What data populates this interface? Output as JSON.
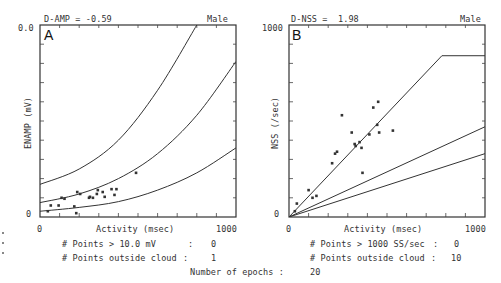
{
  "chart_data": [
    {
      "type": "scatter",
      "panel": "A",
      "title": "D-AMP = -0.59",
      "subtitle": "Male",
      "xlabel": "Activity (msec)",
      "ylabel": "ENAMP (mV)",
      "xlim": [
        0,
        1000
      ],
      "ylim": [
        0,
        10.0
      ],
      "x_tick_labels": [
        "0",
        "1000"
      ],
      "y_tick_labels": [
        "0",
        "0.0"
      ],
      "grid": false,
      "curves": [
        {
          "name": "upper",
          "points": [
            [
              0,
              1.7
            ],
            [
              200,
              2.5
            ],
            [
              400,
              4.0
            ],
            [
              600,
              6.6
            ],
            [
              800,
              10.0
            ]
          ]
        },
        {
          "name": "middle",
          "points": [
            [
              0,
              0.75
            ],
            [
              200,
              1.2
            ],
            [
              400,
              2.0
            ],
            [
              600,
              3.3
            ],
            [
              800,
              5.3
            ],
            [
              1000,
              8.1
            ]
          ]
        },
        {
          "name": "lower",
          "points": [
            [
              0,
              0.3
            ],
            [
              200,
              0.5
            ],
            [
              400,
              0.8
            ],
            [
              600,
              1.4
            ],
            [
              800,
              2.3
            ],
            [
              1000,
              3.6
            ]
          ]
        }
      ],
      "points": [
        [
          40,
          0.3
        ],
        [
          55,
          0.6
        ],
        [
          95,
          0.6
        ],
        [
          110,
          1.0
        ],
        [
          125,
          0.95
        ],
        [
          175,
          0.55
        ],
        [
          185,
          0.2
        ],
        [
          190,
          1.3
        ],
        [
          205,
          1.2
        ],
        [
          250,
          1.0
        ],
        [
          255,
          1.05
        ],
        [
          270,
          1.0
        ],
        [
          290,
          1.2
        ],
        [
          295,
          1.4
        ],
        [
          320,
          1.3
        ],
        [
          330,
          1.05
        ],
        [
          365,
          1.45
        ],
        [
          380,
          1.15
        ],
        [
          390,
          1.45
        ],
        [
          490,
          2.3
        ]
      ],
      "stats": [
        {
          "label": "# Points > 10.0 mV",
          "value": "0"
        },
        {
          "label": "# Points outside cloud",
          "value": "1"
        }
      ]
    },
    {
      "type": "scatter",
      "panel": "B",
      "title": "D-NSS =  1.98",
      "subtitle": "Male",
      "xlabel": "Activity (msec)",
      "ylabel": "NSS (/sec)",
      "xlim": [
        0,
        1000
      ],
      "ylim": [
        0,
        1000
      ],
      "x_tick_labels": [
        "0",
        "1000"
      ],
      "y_tick_labels": [
        "0",
        "1000"
      ],
      "grid": false,
      "curves": [
        {
          "name": "upper",
          "points": [
            [
              0,
              0
            ],
            [
              780,
              840
            ],
            [
              1000,
              840
            ]
          ]
        },
        {
          "name": "middle",
          "points": [
            [
              0,
              0
            ],
            [
              1000,
              470
            ]
          ]
        },
        {
          "name": "lower",
          "points": [
            [
              0,
              0
            ],
            [
              1000,
              330
            ]
          ]
        }
      ],
      "points": [
        [
          30,
          30
        ],
        [
          40,
          70
        ],
        [
          100,
          140
        ],
        [
          120,
          100
        ],
        [
          140,
          110
        ],
        [
          220,
          280
        ],
        [
          235,
          330
        ],
        [
          245,
          340
        ],
        [
          270,
          530
        ],
        [
          320,
          440
        ],
        [
          335,
          380
        ],
        [
          340,
          370
        ],
        [
          360,
          390
        ],
        [
          370,
          360
        ],
        [
          375,
          230
        ],
        [
          410,
          430
        ],
        [
          430,
          570
        ],
        [
          450,
          480
        ],
        [
          455,
          600
        ],
        [
          460,
          440
        ],
        [
          530,
          450
        ]
      ],
      "stats": [
        {
          "label": "# Points > 1000 SS/sec",
          "value": "0"
        },
        {
          "label": "# Points outside cloud",
          "value": "10"
        }
      ]
    }
  ],
  "panelA": {
    "title": "D-AMP = -0.59",
    "sex": "Male",
    "letter": "A",
    "ytop": "0.0",
    "ybottom": "0",
    "xleft": "0",
    "xright": "1000",
    "xlabel": "Activity (msec)",
    "ylabel": "ENAMP (mV)",
    "stat1_label": "# Points > 10.0 mV",
    "stat1_sep": ":",
    "stat1_value": "0",
    "stat2_label": "# Points outside cloud",
    "stat2_sep": ":",
    "stat2_value": "1"
  },
  "panelB": {
    "title": "D-NSS =  1.98",
    "sex": "Male",
    "letter": "B",
    "ytop": "1000",
    "ybottom": "0",
    "xleft": "0",
    "xright": "1000",
    "xlabel": "Activity (msec)",
    "ylabel": "NSS (/sec)",
    "stat1_label": "# Points > 1000 SS/sec",
    "stat1_sep": ":",
    "stat1_value": "0",
    "stat2_label": "# Points outside cloud",
    "stat2_sep": ":",
    "stat2_value": "10"
  },
  "footer": {
    "epochs_label": "Number of epochs :",
    "epochs_value": "20"
  }
}
